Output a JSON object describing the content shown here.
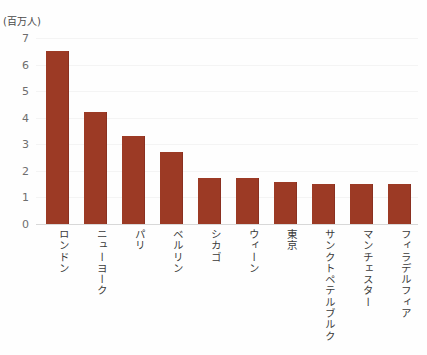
{
  "chart_data": {
    "type": "bar",
    "title": "",
    "subtitle": "",
    "xlabel": "",
    "ylabel": "(百万人)",
    "ylim": [
      0,
      7
    ],
    "ytick_step": 1,
    "yticks": [
      "7",
      "6",
      "5",
      "4",
      "3",
      "2",
      "1",
      "0"
    ],
    "grid": true,
    "legend": false,
    "legend_position": "none",
    "orientation": "vertical",
    "categories": [
      "ロンドン",
      "ニューヨーク",
      "パリ",
      "ベルリン",
      "シカゴ",
      "ウィーン",
      "東京",
      "サンクトペテルブルク",
      "マンチェスター",
      "フィラデルフィア"
    ],
    "values": [
      6.5,
      4.2,
      3.3,
      2.7,
      1.75,
      1.75,
      1.6,
      1.5,
      1.5,
      1.5
    ],
    "bar_color": "#9c3a25",
    "background_color": "#fefefe",
    "gridline_color": "#f4f4f4",
    "axis_color": "#d8d8d8",
    "tick_text_color": "#6e6e6e",
    "category_text_color": "#3a3a3a"
  }
}
